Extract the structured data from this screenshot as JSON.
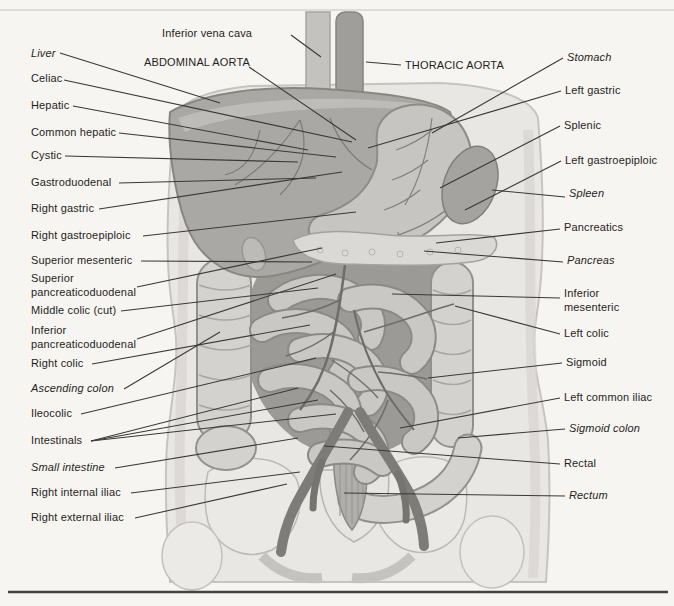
{
  "labels": {
    "top": [
      {
        "name": "inferior-vena-cava",
        "text": "Inferior vena cava"
      },
      {
        "name": "abdominal-aorta",
        "text": "ABDOMINAL AORTA"
      },
      {
        "name": "thoracic-aorta",
        "text": "THORACIC AORTA"
      }
    ],
    "left": [
      {
        "name": "liver",
        "text": "Liver",
        "italic": true
      },
      {
        "name": "celiac",
        "text": "Celiac"
      },
      {
        "name": "hepatic",
        "text": "Hepatic"
      },
      {
        "name": "common-hepatic",
        "text": "Common hepatic"
      },
      {
        "name": "cystic",
        "text": "Cystic"
      },
      {
        "name": "gastroduodenal",
        "text": "Gastroduodenal"
      },
      {
        "name": "right-gastric",
        "text": "Right gastric"
      },
      {
        "name": "right-gastroepiploic",
        "text": "Right gastroepiploic"
      },
      {
        "name": "superior-mesenteric",
        "text": "Superior mesenteric"
      },
      {
        "name": "superior-pancreaticoduodenal",
        "text": "Superior pancreaticoduodenal"
      },
      {
        "name": "middle-colic-cut",
        "text": "Middle colic (cut)"
      },
      {
        "name": "inferior-pancreaticoduodenal",
        "text": "Inferior pancreaticoduodenal"
      },
      {
        "name": "right-colic",
        "text": "Right colic"
      },
      {
        "name": "ascending-colon",
        "text": "Ascending colon",
        "italic": true
      },
      {
        "name": "ileocolic",
        "text": "Ileocolic"
      },
      {
        "name": "intestinals",
        "text": "Intestinals"
      },
      {
        "name": "small-intestine",
        "text": "Small intestine",
        "italic": true
      },
      {
        "name": "right-internal-iliac",
        "text": "Right internal iliac"
      },
      {
        "name": "right-external-iliac",
        "text": "Right external iliac"
      }
    ],
    "right": [
      {
        "name": "stomach",
        "text": "Stomach",
        "italic": true
      },
      {
        "name": "left-gastric",
        "text": "Left gastric"
      },
      {
        "name": "splenic",
        "text": "Splenic"
      },
      {
        "name": "left-gastroepiploic",
        "text": "Left gastroepiploic"
      },
      {
        "name": "spleen",
        "text": "Spleen",
        "italic": true
      },
      {
        "name": "pancreatics",
        "text": "Pancreatics"
      },
      {
        "name": "pancreas",
        "text": "Pancreas",
        "italic": true
      },
      {
        "name": "inferior-mesenteric",
        "text": "Inferior mesenteric"
      },
      {
        "name": "left-colic",
        "text": "Left colic"
      },
      {
        "name": "sigmoid",
        "text": "Sigmoid"
      },
      {
        "name": "left-common-iliac",
        "text": "Left common iliac"
      },
      {
        "name": "sigmoid-colon",
        "text": "Sigmoid colon",
        "italic": true
      },
      {
        "name": "rectal",
        "text": "Rectal"
      },
      {
        "name": "rectum",
        "text": "Rectum",
        "italic": true
      }
    ]
  },
  "colors": {
    "page_background": "#f7f5f2",
    "leader_line": "#3b3936",
    "label_text": "#1f1e1c",
    "bottom_rule": "#454440"
  }
}
